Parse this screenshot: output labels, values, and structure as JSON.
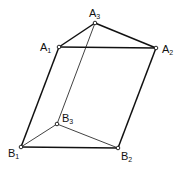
{
  "diagram": {
    "type": "prism",
    "vertices": [
      {
        "id": "A1",
        "letter": "A",
        "sub": "1",
        "x": 59,
        "y": 47,
        "lx": 40,
        "ly": 42
      },
      {
        "id": "A2",
        "letter": "A",
        "sub": "2",
        "x": 156,
        "y": 48,
        "lx": 162,
        "ly": 44
      },
      {
        "id": "A3",
        "letter": "A",
        "sub": "3",
        "x": 95,
        "y": 23,
        "lx": 89,
        "ly": 8
      },
      {
        "id": "B1",
        "letter": "B",
        "sub": "1",
        "x": 21,
        "y": 147,
        "lx": 8,
        "ly": 148
      },
      {
        "id": "B2",
        "letter": "B",
        "sub": "2",
        "x": 118,
        "y": 148,
        "lx": 121,
        "ly": 151
      },
      {
        "id": "B3",
        "letter": "B",
        "sub": "3",
        "x": 57,
        "y": 124,
        "lx": 62,
        "ly": 113
      }
    ],
    "edges": [
      {
        "from": "A1",
        "to": "A2",
        "weight": "bold"
      },
      {
        "from": "A1",
        "to": "A3",
        "weight": "bold"
      },
      {
        "from": "A3",
        "to": "A2",
        "weight": "bold"
      },
      {
        "from": "A1",
        "to": "B1",
        "weight": "bold"
      },
      {
        "from": "A2",
        "to": "B2",
        "weight": "bold"
      },
      {
        "from": "A3",
        "to": "B3",
        "weight": "thin"
      },
      {
        "from": "B1",
        "to": "B2",
        "weight": "bold"
      },
      {
        "from": "B1",
        "to": "B3",
        "weight": "thin"
      },
      {
        "from": "B3",
        "to": "B2",
        "weight": "thin"
      }
    ],
    "stroke_color": "#111111"
  }
}
